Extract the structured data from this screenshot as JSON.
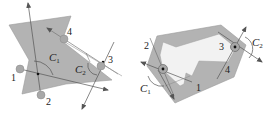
{
  "colors": {
    "polygon_fill": "#b3b3b3",
    "polygon_inner": "#f2f2f2",
    "line": "#555555",
    "finger_fill": "#a8a8a8",
    "finger_stroke": "#777777",
    "contact_dot": "#111111"
  },
  "left_figure": {
    "labels": {
      "p1": "1",
      "p2": "2",
      "p3": "3",
      "p4": "4",
      "c1_main": "C",
      "c1_sub": "1",
      "c2_main": "C",
      "c2_sub": "2"
    }
  },
  "right_figure": {
    "labels": {
      "p1": "1",
      "p2": "2",
      "p3": "3",
      "p4": "4",
      "c1_main": "C",
      "c1_sub": "1",
      "c2_main": "C",
      "c2_sub": "2"
    }
  }
}
